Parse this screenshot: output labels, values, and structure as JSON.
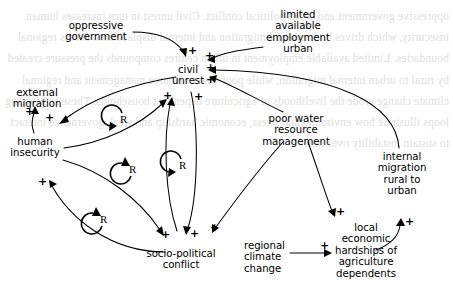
{
  "diagram": {
    "type": "causal-loop-diagram",
    "background": "#ffffff",
    "ink": "#000000",
    "ghost_text": "oppressive government and socio-political conflict. Civil unrest in turn increases human insecurity, which drives both external migration and internal displacement across regional boundaries. Limited available employment in urban centres compounds the pressure created by rural to urban internal migration, while poor water resource management and regional climate change erode the livelihoods of agriculture dependent households. These reinforcing loops illustrate how environmental stress, economic hardship and weak governance interact to sustain instability over time."
  },
  "nodes": [
    {
      "id": "oppressive_government",
      "label": "oppressive\ngovernment",
      "line1": "oppressive",
      "line2": "government"
    },
    {
      "id": "limited_employment",
      "label": "limited available employment urban",
      "line1": "limited",
      "line2": "available",
      "line3": "employment",
      "line4": "urban"
    },
    {
      "id": "civil_unrest",
      "label": "civil unrest",
      "line1": "civil",
      "line2": "unrest"
    },
    {
      "id": "external_migration",
      "label": "external migration",
      "line1": "external",
      "line2": "migration"
    },
    {
      "id": "human_insecurity",
      "label": "human insecurity",
      "line1": "human",
      "line2": "insecurity"
    },
    {
      "id": "poor_water",
      "label": "poor water resource management",
      "line1": "poor water",
      "line2": "resource",
      "line3": "management"
    },
    {
      "id": "internal_migration",
      "label": "internal migration rural to urban",
      "line1": "internal",
      "line2": "migration",
      "line3": "rural to",
      "line4": "urban"
    },
    {
      "id": "socio_political_conflict",
      "label": "socio-political conflict",
      "line1": "socio-political",
      "line2": "conflict"
    },
    {
      "id": "regional_climate_change",
      "label": "regional climate change",
      "line1": "regional",
      "line2": "climate",
      "line3": "change"
    },
    {
      "id": "local_economic_hardships",
      "label": "local economic hardships of agriculture dependents",
      "line1": "local",
      "line2": "economic",
      "line3": "hardships of",
      "line4": "agriculture",
      "line5": "dependents"
    }
  ],
  "links": [
    {
      "from": "oppressive_government",
      "to": "civil_unrest",
      "polarity": "+"
    },
    {
      "from": "limited_employment",
      "to": "civil_unrest",
      "polarity": "+"
    },
    {
      "from": "internal_migration",
      "to": "civil_unrest",
      "polarity": "+"
    },
    {
      "from": "poor_water",
      "to": "civil_unrest",
      "polarity": "+"
    },
    {
      "from": "civil_unrest",
      "to": "human_insecurity",
      "polarity": "+"
    },
    {
      "from": "human_insecurity",
      "to": "external_migration",
      "polarity": "+"
    },
    {
      "from": "human_insecurity",
      "to": "civil_unrest",
      "polarity": "+"
    },
    {
      "from": "human_insecurity",
      "to": "socio_political_conflict",
      "polarity": "+"
    },
    {
      "from": "socio_political_conflict",
      "to": "human_insecurity",
      "polarity": "+"
    },
    {
      "from": "socio_political_conflict",
      "to": "civil_unrest",
      "polarity": "+"
    },
    {
      "from": "civil_unrest",
      "to": "socio_political_conflict",
      "polarity": "+"
    },
    {
      "from": "poor_water",
      "to": "socio_political_conflict",
      "polarity": "+"
    },
    {
      "from": "poor_water",
      "to": "local_economic_hardships",
      "polarity": "+"
    },
    {
      "from": "regional_climate_change",
      "to": "local_economic_hardships",
      "polarity": "+"
    },
    {
      "from": "local_economic_hardships",
      "to": "internal_migration",
      "polarity": "+"
    }
  ],
  "loops": [
    {
      "id": "loop_r1",
      "label": "R",
      "type": "reinforcing",
      "direction": "clockwise"
    },
    {
      "id": "loop_r2",
      "label": "R",
      "type": "reinforcing",
      "direction": "counter-clockwise"
    },
    {
      "id": "loop_r3",
      "label": "R",
      "type": "reinforcing",
      "direction": "clockwise"
    },
    {
      "id": "loop_r4",
      "label": "R",
      "type": "reinforcing",
      "direction": "counter-clockwise"
    }
  ],
  "polarity_marks": {
    "p_og_cu": "+",
    "p_le_cu": "+",
    "p_im_cu": "+",
    "p_pw_cu": "+",
    "p_cu_hi": "+",
    "p_hi_em": "+",
    "p_hi_cu": "+",
    "p_spc_cu": "+",
    "p_hi_spc": "+",
    "p_spc_hi": "+",
    "p_cu_spc": "+",
    "p_pw_spc": "+",
    "p_pw_leh": "+",
    "p_rcc_leh": "+",
    "p_leh_im": "+"
  }
}
